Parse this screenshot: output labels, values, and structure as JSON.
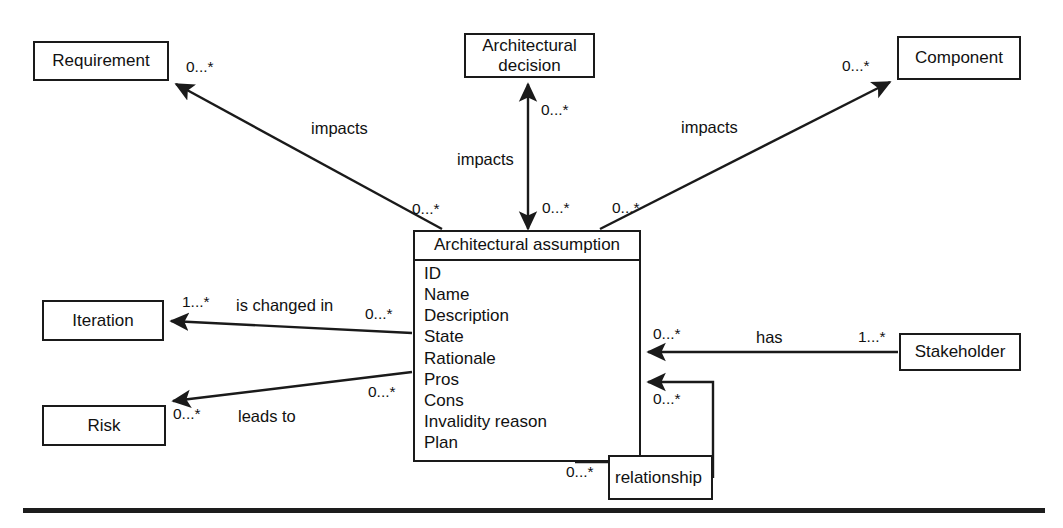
{
  "diagram": {
    "type": "uml-class-diagram",
    "line_color": "#1a1a1a",
    "background_color": "#ffffff",
    "classes": [
      {
        "id": "requirement",
        "name": "Requirement",
        "attributes": []
      },
      {
        "id": "architectural-decision",
        "name_line1": "Architectural",
        "name_line2": "decision",
        "attributes": []
      },
      {
        "id": "component",
        "name": "Component",
        "attributes": []
      },
      {
        "id": "iteration",
        "name": "Iteration",
        "attributes": []
      },
      {
        "id": "risk",
        "name": "Risk",
        "attributes": []
      },
      {
        "id": "stakeholder",
        "name": "Stakeholder",
        "attributes": []
      },
      {
        "id": "architectural-assumption",
        "name": "Architectural assumption",
        "attributes": [
          "ID",
          "Name",
          "Description",
          "State",
          "Rationale",
          "Pros",
          "Cons",
          "Invalidity reason",
          "Plan"
        ]
      },
      {
        "id": "relationship",
        "name": "relationship",
        "attributes": []
      }
    ],
    "associations": [
      {
        "id": "assumption-impacts-requirement",
        "label": "impacts",
        "source": "architectural-assumption",
        "target": "requirement",
        "source_multiplicity": "0...*",
        "target_multiplicity": "0...*"
      },
      {
        "id": "assumption-impacts-decision",
        "label": "impacts",
        "source": "architectural-assumption",
        "target": "architectural-decision",
        "source_multiplicity": "0...*",
        "target_multiplicity": "0...*"
      },
      {
        "id": "assumption-impacts-component",
        "label": "impacts",
        "source": "architectural-assumption",
        "target": "component",
        "source_multiplicity": "0...*",
        "target_multiplicity": "0...*"
      },
      {
        "id": "assumption-is-changed-in-iteration",
        "label": "is changed in",
        "source": "architectural-assumption",
        "target": "iteration",
        "source_multiplicity": "0...*",
        "target_multiplicity": "1...*"
      },
      {
        "id": "assumption-leads-to-risk",
        "label": "leads to",
        "source": "architectural-assumption",
        "target": "risk",
        "source_multiplicity": "0...*",
        "target_multiplicity": "0...*"
      },
      {
        "id": "stakeholder-has-assumption",
        "label": "has",
        "source": "stakeholder",
        "target": "architectural-assumption",
        "source_multiplicity": "1...*",
        "target_multiplicity": "0...*"
      },
      {
        "id": "assumption-relationship-self",
        "label": "relationship",
        "source": "architectural-assumption",
        "target": "architectural-assumption",
        "source_multiplicity": "0...*",
        "target_multiplicity": "0...*"
      }
    ],
    "labels": {
      "impacts_requirement": "impacts",
      "impacts_decision": "impacts",
      "impacts_component": "impacts",
      "is_changed_in": "is changed in",
      "leads_to": "leads to",
      "has": "has",
      "relationship": "relationship"
    },
    "multiplicities": {
      "requirement_end": "0...*",
      "assumption_to_requirement_end": "0...*",
      "decision_end": "0...*",
      "assumption_to_decision_end": "0...*",
      "component_end": "0...*",
      "assumption_to_component_end": "0...*",
      "iteration_end": "1...*",
      "assumption_to_iteration_end": "0...*",
      "risk_end": "0...*",
      "assumption_to_risk_end": "0...*",
      "stakeholder_end": "1...*",
      "assumption_to_stakeholder_end": "0...*",
      "relationship_top_end": "0...*",
      "relationship_bottom_end": "0...*"
    }
  }
}
